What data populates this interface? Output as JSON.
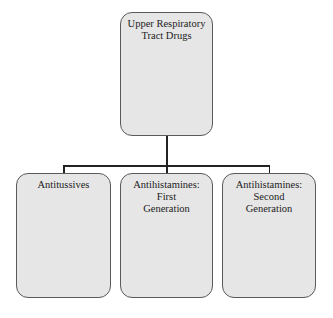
{
  "diagram": {
    "type": "hierarchy",
    "root": {
      "label_line1": "Upper Respiratory",
      "label_line2": "Tract Drugs"
    },
    "children": [
      {
        "label_line1": "Antitussives",
        "label_line2": ""
      },
      {
        "label_line1": "Antihistamines: First",
        "label_line2": "Generation"
      },
      {
        "label_line1": "Antihistamines: Second",
        "label_line2": "Generation"
      }
    ],
    "colors": {
      "node_fill": "#e6e6e6",
      "node_border": "#5a5a5a",
      "connector": "#222222",
      "text": "#222222"
    }
  }
}
